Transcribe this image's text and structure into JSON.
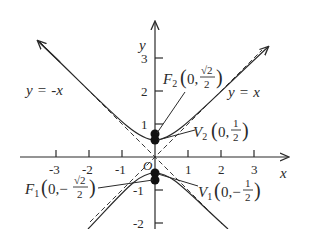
{
  "diagram": {
    "type": "hyperbola-graph",
    "equation": "y^2 - x^2 = 1/4",
    "axes": {
      "x_label": "x",
      "y_label": "y",
      "origin_label": "O",
      "x_ticks": [
        "-3",
        "-2",
        "-1",
        "1",
        "2",
        "3"
      ],
      "y_ticks": [
        "3",
        "2",
        "1",
        "-1",
        "-2"
      ]
    },
    "asymptotes": [
      {
        "label_lhs": "y",
        "label_eq": "=",
        "label_rhs": "-x"
      },
      {
        "label_lhs": "y",
        "label_eq": "=",
        "label_rhs": "x"
      }
    ],
    "points": {
      "F2": {
        "name": "F",
        "sub": "2",
        "x": "0",
        "y_num": "√2",
        "y_den": "2",
        "sign": ""
      },
      "V2": {
        "name": "V",
        "sub": "2",
        "x": "0",
        "y_num": "1",
        "y_den": "2",
        "sign": ""
      },
      "V1": {
        "name": "V",
        "sub": "1",
        "x": "0",
        "y_num": "1",
        "y_den": "2",
        "sign": "−"
      },
      "F1": {
        "name": "F",
        "sub": "1",
        "x": "0",
        "y_num": "√2",
        "y_den": "2",
        "sign": "−"
      }
    },
    "colors": {
      "ink": "#2a2a2a",
      "background": "#ffffff"
    }
  }
}
